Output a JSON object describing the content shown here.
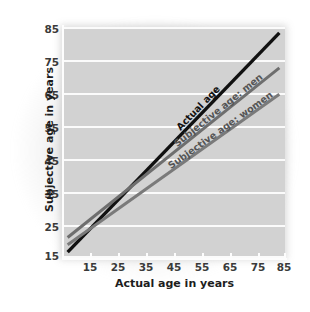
{
  "chart_data": {
    "type": "line",
    "title": "",
    "xlabel": "Actual age in years",
    "ylabel": "Subjective age in years",
    "xlim": [
      8,
      87
    ],
    "ylim": [
      8,
      87
    ],
    "xticks": [
      "15",
      "25",
      "35",
      "45",
      "55",
      "65",
      "75",
      "85"
    ],
    "xtick_values": [
      15,
      25,
      35,
      45,
      55,
      65,
      75,
      85
    ],
    "yticks": [
      "15",
      "25",
      "35",
      "45",
      "55",
      "65",
      "75",
      "85"
    ],
    "ytick_values": [
      15,
      25,
      35,
      45,
      55,
      65,
      75,
      85
    ],
    "grid": "horizontal",
    "legend": "inline-line-labels",
    "series": [
      {
        "name": "Actual age",
        "color": "#111111",
        "x": [
          10,
          85
        ],
        "values": [
          10,
          85
        ]
      },
      {
        "name": "Subjective age: men",
        "color": "#6e6e6e",
        "x": [
          10,
          85
        ],
        "values": [
          15,
          73
        ]
      },
      {
        "name": "Subjective age: women",
        "color": "#7a7a7a",
        "x": [
          10,
          85
        ],
        "values": [
          12.5,
          64
        ]
      }
    ],
    "annotations": [
      {
        "text": "Actual age",
        "series": "Actual age"
      },
      {
        "text": "Subjective age: men",
        "series": "Subjective age: men"
      },
      {
        "text": "Subjective age: women",
        "series": "Subjective age: women"
      }
    ]
  },
  "colors": {
    "panel_background": "#d2d2d2",
    "gridline": "#fbfbfb",
    "page_background": "#ffffff",
    "actual_age_line": "#111111",
    "men_line": "#6e6e6e",
    "women_line": "#7a7a7a",
    "tick_text": "#3a3a3a",
    "axis_title_text": "#1d1d1d"
  }
}
